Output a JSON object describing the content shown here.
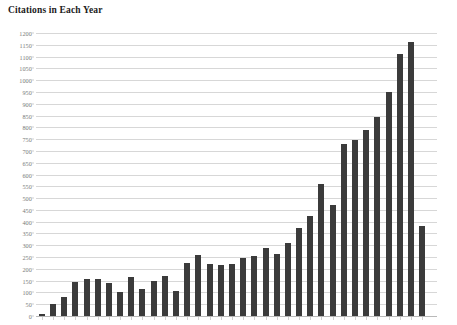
{
  "chart_data": {
    "type": "bar",
    "title": "Citations in Each Year",
    "xlabel": "",
    "ylabel": "",
    "ylim": [
      0,
      1200
    ],
    "ytick_step": 50,
    "grid": true,
    "legend": "none",
    "bar_color": "#3b3b3b",
    "grid_color": "#d7d7d7",
    "background_color": "#ffffff",
    "axis_label_color": "#7b7b7b",
    "title_color": "#1b1b1b",
    "ytick_labels": [
      "1200",
      "1150",
      "1100",
      "1050",
      "1000",
      "950",
      "900",
      "850",
      "800",
      "750",
      "700",
      "650",
      "600",
      "550",
      "500",
      "450",
      "400",
      "350",
      "300",
      "250",
      "200",
      "150",
      "100",
      "50",
      "0"
    ],
    "categories": [
      "1",
      "2",
      "3",
      "4",
      "5",
      "6",
      "7",
      "8",
      "9",
      "10",
      "11",
      "12",
      "13",
      "14",
      "15",
      "16",
      "17",
      "18",
      "19",
      "20",
      "21",
      "22",
      "23",
      "24",
      "25",
      "26",
      "27",
      "28",
      "29",
      "30",
      "31",
      "32",
      "33",
      "34",
      "35"
    ],
    "values": [
      8,
      50,
      80,
      145,
      155,
      155,
      140,
      100,
      165,
      115,
      150,
      170,
      105,
      225,
      260,
      220,
      215,
      220,
      245,
      255,
      290,
      265,
      310,
      375,
      425,
      560,
      470,
      730,
      745,
      790,
      845,
      950,
      1110,
      1160,
      380
    ],
    "n_bars": 35
  }
}
